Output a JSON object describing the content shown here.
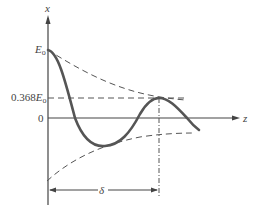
{
  "diagram": {
    "type": "damped-wave-skin-depth",
    "axes": {
      "vertical_label": "x",
      "horizontal_label": "z",
      "zero_label": "0"
    },
    "labels": {
      "amplitude": "E",
      "amplitude_sub": "o",
      "decayed_amplitude_prefix": "0.368",
      "decayed_amplitude": "E",
      "decayed_amplitude_sub": "o",
      "skin_depth": "δ"
    },
    "colors": {
      "curve": "#555555",
      "axis": "#444444",
      "dashed": "#555555",
      "text": "#444444"
    }
  }
}
